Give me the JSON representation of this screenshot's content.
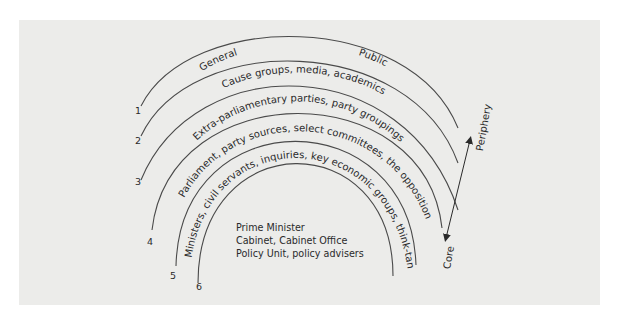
{
  "diagram": {
    "type": "concentric-arcs",
    "axis": {
      "outer_label": "Periphery",
      "inner_label": "Core"
    },
    "rings": [
      {
        "number": "1",
        "label_left": "General",
        "label_right": "Public"
      },
      {
        "number": "2",
        "label": "Cause groups, media, academics"
      },
      {
        "number": "3",
        "label": "Extra-parliamentary parties, party groupings"
      },
      {
        "number": "4",
        "label": "Parliament, party sources, select committees, the opposition"
      },
      {
        "number": "5",
        "label": "Ministers, civil servants, inquiries, key economic groups, think-tanks"
      },
      {
        "number": "6",
        "label": ""
      }
    ],
    "core_lines": [
      "Prime Minister",
      "Cabinet, Cabinet Office",
      "Policy Unit, policy advisers"
    ]
  },
  "colors": {
    "background": "#ececea",
    "stroke": "#4a4a4a",
    "text": "#2a2a2a"
  }
}
